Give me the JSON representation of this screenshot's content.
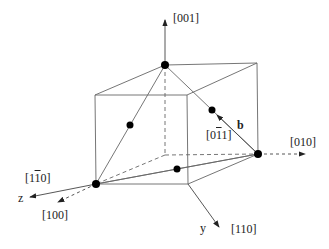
{
  "diagram": {
    "type": "crystal-unit-cell",
    "labels": {
      "dir_001": "[001]",
      "dir_010": "[010]",
      "dir_100": "[100]",
      "dir_110": "[110]",
      "dir_1m10_a": "[1",
      "dir_1m10_bar": "1",
      "dir_1m10_b": "0]",
      "dir_0m11_a": "[0",
      "dir_0m11_bar": "1",
      "dir_0m11_b": "1]",
      "vec_b": "b",
      "axis_z": "z",
      "axis_y": "y"
    },
    "colors": {
      "line": "#555555",
      "atom": "#000000",
      "text": "#222222"
    }
  }
}
